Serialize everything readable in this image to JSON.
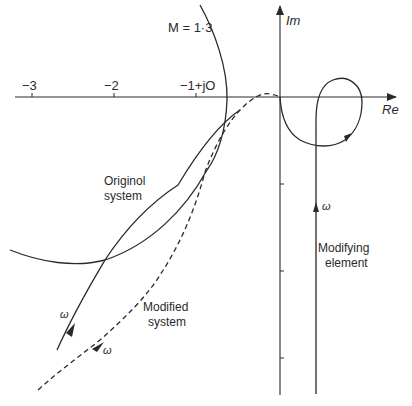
{
  "diagram": {
    "type": "nyquist-plot",
    "axes": {
      "real_label": "Re",
      "imag_label": "Im",
      "real_ticks": [
        {
          "label": "−3",
          "value": -3
        },
        {
          "label": "−2",
          "value": -2
        },
        {
          "label": "−1+jO",
          "value": -1
        }
      ],
      "imag_tick_count": 3
    },
    "m_circle": {
      "label": "M = 1·3"
    },
    "curves": [
      {
        "name": "original-system",
        "label_line1": "Originol",
        "label_line2": "system",
        "style": "solid",
        "freq_label": "ω"
      },
      {
        "name": "modified-system",
        "label_line1": "Modified",
        "label_line2": "system",
        "style": "dashed",
        "freq_label": "ω"
      },
      {
        "name": "modifying-element",
        "label_line1": "Modifying",
        "label_line2": "element",
        "style": "solid",
        "freq_label": "ω"
      }
    ],
    "colors": {
      "ink": "#2a2a2a",
      "background": "#ffffff"
    }
  }
}
